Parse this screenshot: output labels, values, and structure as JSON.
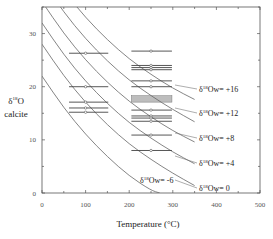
{
  "chart_data": {
    "type": "line",
    "title": "",
    "xlabel": "Temperature (°C)",
    "ylabel_lines": [
      "δ18O",
      "calcite"
    ],
    "ylabel": "δ18O calcite",
    "xlim": [
      0,
      500
    ],
    "ylim": [
      0,
      35
    ],
    "x_ticks": [
      0,
      100,
      200,
      300,
      400,
      500
    ],
    "y_ticks": [
      0,
      10,
      20,
      30
    ],
    "grid": false,
    "legend": "inline curve labels",
    "series": [
      {
        "name": "δ18Ow= +16",
        "label_prefix": "δ",
        "label_sup": "18",
        "label_rest": "Ow= +16",
        "points": [
          [
            0,
            44
          ],
          [
            50,
            38
          ],
          [
            100,
            33
          ],
          [
            150,
            28.8
          ],
          [
            200,
            25.2
          ],
          [
            250,
            22.3
          ],
          [
            300,
            19.7
          ],
          [
            350,
            17.6
          ]
        ]
      },
      {
        "name": "δ18Ow= +12",
        "label_prefix": "δ",
        "label_sup": "18",
        "label_rest": "Ow= +12",
        "points": [
          [
            0,
            40
          ],
          [
            50,
            34
          ],
          [
            100,
            29
          ],
          [
            150,
            24.8
          ],
          [
            200,
            21.2
          ],
          [
            250,
            18.3
          ],
          [
            300,
            15.7
          ],
          [
            350,
            13.4
          ]
        ]
      },
      {
        "name": "δ18Ow= +8",
        "label_prefix": "δ",
        "label_sup": "18",
        "label_rest": "Ow= +8",
        "points": [
          [
            0,
            36
          ],
          [
            50,
            30
          ],
          [
            100,
            25
          ],
          [
            150,
            20.8
          ],
          [
            200,
            17.2
          ],
          [
            250,
            14.3
          ],
          [
            300,
            11.7
          ],
          [
            350,
            9.6
          ]
        ]
      },
      {
        "name": "δ18Ow= +4",
        "label_prefix": "δ",
        "label_sup": "18",
        "label_rest": "Ow= +4",
        "points": [
          [
            0,
            32
          ],
          [
            50,
            26
          ],
          [
            100,
            21
          ],
          [
            150,
            16.8
          ],
          [
            200,
            13.2
          ],
          [
            250,
            10.3
          ],
          [
            300,
            7.7
          ],
          [
            350,
            5.5
          ]
        ]
      },
      {
        "name": "δ18Ow= 0",
        "label_prefix": "δ",
        "label_sup": "18",
        "label_rest": "Ow= 0",
        "points": [
          [
            0,
            28
          ],
          [
            50,
            22
          ],
          [
            100,
            17
          ],
          [
            150,
            12.8
          ],
          [
            200,
            9.2
          ],
          [
            250,
            6.3
          ],
          [
            300,
            3.7
          ],
          [
            350,
            1.4
          ]
        ]
      },
      {
        "name": "δ18Ow= -6",
        "label_prefix": "δ",
        "label_sup": "18",
        "label_rest": "Ow= -6",
        "points": [
          [
            0,
            22
          ],
          [
            50,
            16
          ],
          [
            100,
            11
          ],
          [
            150,
            6.8
          ],
          [
            200,
            3.2
          ],
          [
            250,
            0.5
          ],
          [
            270,
            0
          ]
        ]
      }
    ],
    "measurements": {
      "group_100C": {
        "x_center": 100,
        "x_range": [
          62,
          152
        ],
        "values": [
          26.3,
          20.0,
          17.1,
          16.0,
          15.2
        ]
      },
      "group_250C": {
        "x_center": 250,
        "x_range": [
          205,
          298
        ],
        "values": [
          26.7,
          24.0,
          23.6,
          23.2,
          21.1,
          20.0,
          15.6,
          14.5,
          14.1,
          13.5,
          10.9,
          8.0
        ],
        "shaded_band": [
          17.1,
          18.3
        ]
      }
    }
  }
}
